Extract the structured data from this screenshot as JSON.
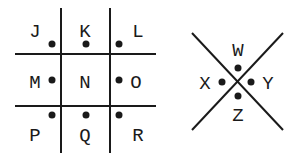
{
  "grid": {
    "letters": [
      "J",
      "K",
      "L",
      "M",
      "N",
      "O",
      "P",
      "Q",
      "R"
    ]
  },
  "cross": {
    "letters": {
      "top": "W",
      "left": "X",
      "right": "Y",
      "bottom": "Z"
    }
  },
  "colors": {
    "ink": "#1a1a1a",
    "background": "#ffffff"
  }
}
